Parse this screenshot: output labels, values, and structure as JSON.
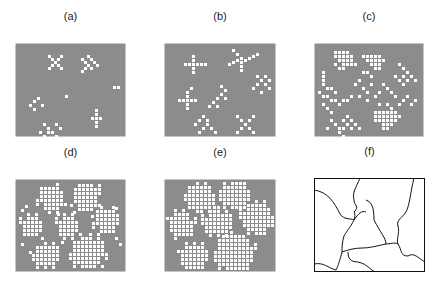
{
  "colors": {
    "background": "#8c8c8c",
    "cell": "#ffffff",
    "line": "#111111"
  },
  "panels": [
    {
      "label": "(a)",
      "x": 15,
      "y": 43,
      "w": 111,
      "h": 94,
      "type": "grid",
      "cells": [
        [
          33,
          12
        ],
        [
          36,
          15
        ],
        [
          39,
          18
        ],
        [
          42,
          21
        ],
        [
          45,
          24
        ],
        [
          45,
          12
        ],
        [
          42,
          15
        ],
        [
          36,
          21
        ],
        [
          33,
          24
        ],
        [
          66,
          15
        ],
        [
          69,
          18
        ],
        [
          72,
          21
        ],
        [
          75,
          24
        ],
        [
          78,
          18
        ],
        [
          75,
          15
        ],
        [
          72,
          12
        ],
        [
          69,
          24
        ],
        [
          66,
          27
        ],
        [
          81,
          21
        ],
        [
          98,
          43
        ],
        [
          102,
          43
        ],
        [
          50,
          52
        ],
        [
          14,
          61
        ],
        [
          18,
          57
        ],
        [
          22,
          54
        ],
        [
          18,
          65
        ],
        [
          26,
          61
        ],
        [
          28,
          80
        ],
        [
          32,
          84
        ],
        [
          36,
          88
        ],
        [
          40,
          92
        ],
        [
          28,
          92
        ],
        [
          32,
          88
        ],
        [
          40,
          80
        ],
        [
          24,
          88
        ],
        [
          44,
          84
        ],
        [
          80,
          66
        ],
        [
          80,
          70
        ],
        [
          80,
          74
        ],
        [
          80,
          78
        ],
        [
          80,
          82
        ],
        [
          76,
          74
        ],
        [
          84,
          74
        ]
      ]
    },
    {
      "label": "(b)",
      "x": 164,
      "y": 43,
      "w": 112,
      "h": 94,
      "type": "grid",
      "cells": [
        [
          28,
          12
        ],
        [
          28,
          16
        ],
        [
          28,
          20
        ],
        [
          28,
          24
        ],
        [
          28,
          28
        ],
        [
          20,
          20
        ],
        [
          24,
          20
        ],
        [
          32,
          20
        ],
        [
          36,
          20
        ],
        [
          40,
          20
        ],
        [
          68,
          6
        ],
        [
          72,
          10
        ],
        [
          76,
          14
        ],
        [
          76,
          18
        ],
        [
          76,
          22
        ],
        [
          76,
          26
        ],
        [
          64,
          20
        ],
        [
          68,
          18
        ],
        [
          72,
          16
        ],
        [
          80,
          16
        ],
        [
          84,
          14
        ],
        [
          88,
          12
        ],
        [
          92,
          10
        ],
        [
          92,
          32
        ],
        [
          96,
          36
        ],
        [
          100,
          40
        ],
        [
          104,
          44
        ],
        [
          88,
          44
        ],
        [
          92,
          40
        ],
        [
          100,
          32
        ],
        [
          104,
          36
        ],
        [
          96,
          48
        ],
        [
          14,
          56
        ],
        [
          18,
          56
        ],
        [
          22,
          56
        ],
        [
          26,
          56
        ],
        [
          30,
          56
        ],
        [
          22,
          48
        ],
        [
          22,
          52
        ],
        [
          22,
          60
        ],
        [
          22,
          64
        ],
        [
          26,
          44
        ],
        [
          56,
          42
        ],
        [
          60,
          46
        ],
        [
          56,
          50
        ],
        [
          52,
          54
        ],
        [
          48,
          58
        ],
        [
          44,
          62
        ],
        [
          60,
          54
        ],
        [
          52,
          62
        ],
        [
          30,
          80
        ],
        [
          34,
          76
        ],
        [
          38,
          84
        ],
        [
          42,
          80
        ],
        [
          46,
          84
        ],
        [
          50,
          88
        ],
        [
          38,
          72
        ],
        [
          34,
          88
        ],
        [
          42,
          76
        ],
        [
          72,
          72
        ],
        [
          76,
          76
        ],
        [
          80,
          80
        ],
        [
          84,
          84
        ],
        [
          88,
          88
        ],
        [
          84,
          76
        ],
        [
          76,
          84
        ],
        [
          72,
          88
        ],
        [
          88,
          72
        ]
      ]
    },
    {
      "label": "(c)",
      "x": 314,
      "y": 43,
      "w": 110,
      "h": 94,
      "type": "grid",
      "cells": [
        [
          20,
          8
        ],
        [
          24,
          8
        ],
        [
          28,
          8
        ],
        [
          32,
          8
        ],
        [
          20,
          12
        ],
        [
          24,
          12
        ],
        [
          28,
          12
        ],
        [
          32,
          12
        ],
        [
          36,
          12
        ],
        [
          24,
          16
        ],
        [
          28,
          16
        ],
        [
          32,
          16
        ],
        [
          36,
          16
        ],
        [
          28,
          20
        ],
        [
          32,
          20
        ],
        [
          36,
          20
        ],
        [
          40,
          20
        ],
        [
          20,
          20
        ],
        [
          24,
          24
        ],
        [
          28,
          24
        ],
        [
          48,
          12
        ],
        [
          52,
          12
        ],
        [
          56,
          12
        ],
        [
          60,
          12
        ],
        [
          64,
          12
        ],
        [
          52,
          16
        ],
        [
          56,
          16
        ],
        [
          60,
          16
        ],
        [
          64,
          16
        ],
        [
          68,
          16
        ],
        [
          56,
          20
        ],
        [
          60,
          20
        ],
        [
          64,
          20
        ],
        [
          60,
          24
        ],
        [
          64,
          24
        ],
        [
          48,
          28
        ],
        [
          52,
          28
        ],
        [
          56,
          32
        ],
        [
          84,
          20
        ],
        [
          88,
          24
        ],
        [
          92,
          28
        ],
        [
          96,
          32
        ],
        [
          80,
          32
        ],
        [
          84,
          36
        ],
        [
          88,
          32
        ],
        [
          92,
          36
        ],
        [
          100,
          36
        ],
        [
          88,
          40
        ],
        [
          8,
          28
        ],
        [
          8,
          32
        ],
        [
          8,
          36
        ],
        [
          8,
          40
        ],
        [
          12,
          44
        ],
        [
          16,
          44
        ],
        [
          20,
          48
        ],
        [
          4,
          48
        ],
        [
          8,
          52
        ],
        [
          12,
          52
        ],
        [
          16,
          56
        ],
        [
          20,
          56
        ],
        [
          24,
          60
        ],
        [
          8,
          60
        ],
        [
          12,
          64
        ],
        [
          16,
          68
        ],
        [
          40,
          40
        ],
        [
          44,
          36
        ],
        [
          48,
          44
        ],
        [
          52,
          48
        ],
        [
          44,
          52
        ],
        [
          36,
          52
        ],
        [
          32,
          56
        ],
        [
          28,
          56
        ],
        [
          52,
          56
        ],
        [
          56,
          40
        ],
        [
          68,
          40
        ],
        [
          72,
          44
        ],
        [
          76,
          48
        ],
        [
          64,
          48
        ],
        [
          60,
          52
        ],
        [
          80,
          52
        ],
        [
          88,
          56
        ],
        [
          92,
          52
        ],
        [
          96,
          60
        ],
        [
          100,
          56
        ],
        [
          84,
          60
        ],
        [
          60,
          68
        ],
        [
          64,
          68
        ],
        [
          68,
          68
        ],
        [
          72,
          68
        ],
        [
          76,
          68
        ],
        [
          80,
          68
        ],
        [
          60,
          72
        ],
        [
          64,
          72
        ],
        [
          68,
          72
        ],
        [
          72,
          72
        ],
        [
          76,
          72
        ],
        [
          80,
          72
        ],
        [
          84,
          72
        ],
        [
          60,
          76
        ],
        [
          64,
          76
        ],
        [
          68,
          76
        ],
        [
          72,
          76
        ],
        [
          76,
          76
        ],
        [
          80,
          76
        ],
        [
          68,
          80
        ],
        [
          72,
          80
        ],
        [
          76,
          80
        ],
        [
          68,
          84
        ],
        [
          72,
          84
        ],
        [
          64,
          60
        ],
        [
          72,
          60
        ],
        [
          76,
          64
        ],
        [
          16,
          76
        ],
        [
          20,
          80
        ],
        [
          24,
          84
        ],
        [
          28,
          84
        ],
        [
          32,
          80
        ],
        [
          36,
          84
        ],
        [
          40,
          80
        ],
        [
          12,
          84
        ],
        [
          28,
          76
        ],
        [
          32,
          72
        ],
        [
          36,
          76
        ],
        [
          44,
          84
        ],
        [
          24,
          88
        ],
        [
          28,
          92
        ]
      ]
    },
    {
      "label": "(d)",
      "x": 15,
      "y": 179,
      "w": 111,
      "h": 93,
      "type": "blobs",
      "blobs": [
        {
          "cx": 35,
          "cy": 18,
          "r": 14
        },
        {
          "cx": 70,
          "cy": 16,
          "r": 15
        },
        {
          "cx": 90,
          "cy": 40,
          "r": 13
        },
        {
          "cx": 15,
          "cy": 45,
          "r": 11
        },
        {
          "cx": 52,
          "cy": 46,
          "r": 12
        },
        {
          "cx": 72,
          "cy": 72,
          "r": 18
        },
        {
          "cx": 30,
          "cy": 76,
          "r": 13
        }
      ],
      "cells": [
        [
          6,
          30
        ],
        [
          10,
          26
        ],
        [
          26,
          58
        ],
        [
          42,
          34
        ],
        [
          58,
          32
        ],
        [
          76,
          36
        ],
        [
          100,
          28
        ],
        [
          6,
          64
        ],
        [
          14,
          72
        ],
        [
          46,
          62
        ],
        [
          100,
          58
        ],
        [
          104,
          64
        ]
      ]
    },
    {
      "label": "(e)",
      "x": 164,
      "y": 179,
      "w": 112,
      "h": 93,
      "type": "blobs",
      "blobs": [
        {
          "cx": 35,
          "cy": 18,
          "r": 15
        },
        {
          "cx": 70,
          "cy": 14,
          "r": 15
        },
        {
          "cx": 92,
          "cy": 38,
          "r": 17
        },
        {
          "cx": 16,
          "cy": 44,
          "r": 14
        },
        {
          "cx": 52,
          "cy": 42,
          "r": 15
        },
        {
          "cx": 70,
          "cy": 72,
          "r": 20
        },
        {
          "cx": 28,
          "cy": 78,
          "r": 15
        }
      ],
      "cells": []
    },
    {
      "label": "(f)",
      "x": 314,
      "y": 178,
      "w": 111,
      "h": 94,
      "type": "lines",
      "paths": [
        "M0,12 C14,14 20,24 26,36 C30,42 36,40 40,42",
        "M46,0 C42,10 38,14 40,22 C40,28 46,28 40,34 C42,36 40,42 40,42",
        "M40,42 C44,36 48,32 52,34",
        "M40,42 C36,50 32,54 30,58 C28,64 28,70 28,74",
        "M28,74 C34,72 40,70 48,70 C56,70 62,68 72,66 C72,60 66,54 60,42 C60,30 58,24 52,22",
        "M72,66 C76,66 80,64 84,66",
        "M84,66 C82,60 86,56 84,48 C82,42 88,40 92,34 C96,26 96,16 100,0",
        "M84,66 C88,72 86,78 94,78 C100,74 104,80 111,84",
        "M28,74 C26,82 24,88 22,92 C14,90 10,84 0,86",
        "M34,74 C34,80 36,84 44,84 C54,86 58,94 62,94"
      ]
    }
  ]
}
